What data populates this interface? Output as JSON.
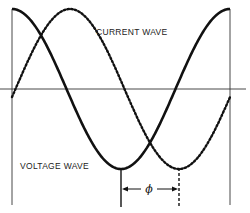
{
  "diagram": {
    "labels": {
      "current_wave": "CURRENT WAVE",
      "voltage_wave": "VOLTAGE WAVE",
      "phase_symbol": "ϕ"
    },
    "geometry": {
      "x_left": 12,
      "x_right": 230,
      "axis_y": 89,
      "axis_x_end": 246,
      "amplitude": 80,
      "period_px": 218,
      "phase_shift_px": 58
    },
    "series": [
      {
        "name": "voltage wave",
        "style": "solid",
        "shape": "cosine",
        "color": "#111111"
      },
      {
        "name": "current wave",
        "style": "dotted",
        "shape": "cosine lagging by phi",
        "color": "#111111"
      }
    ]
  }
}
